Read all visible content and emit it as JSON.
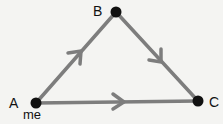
{
  "diagram": {
    "type": "directed-triangle",
    "nodes": [
      {
        "id": "A",
        "label": "A",
        "sublabel": "me",
        "x": 36,
        "y": 103
      },
      {
        "id": "B",
        "label": "B",
        "x": 116,
        "y": 12
      },
      {
        "id": "C",
        "label": "C",
        "x": 198,
        "y": 101
      }
    ],
    "edges": [
      {
        "from": "A",
        "to": "B",
        "arrow": "mid"
      },
      {
        "from": "B",
        "to": "C",
        "arrow": "mid"
      },
      {
        "from": "A",
        "to": "C",
        "arrow": "mid"
      }
    ],
    "colors": {
      "edge": "#7d7d7d",
      "node": "#111111",
      "background": "#f4f4f2"
    }
  }
}
